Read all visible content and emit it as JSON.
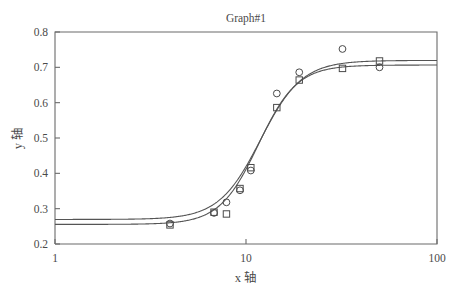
{
  "chart_data": {
    "type": "line",
    "title": "Graph#1",
    "xlabel": "x 轴",
    "ylabel": "y 轴",
    "xscale": "log",
    "yscale": "linear",
    "xlim": [
      1,
      100
    ],
    "ylim": [
      0.2,
      0.8
    ],
    "xticks": [
      1,
      10,
      100
    ],
    "xtick_labels": [
      "1",
      "10",
      "100"
    ],
    "yticks": [
      0.2,
      0.3,
      0.4,
      0.5,
      0.6,
      0.7,
      0.8
    ],
    "ytick_labels": [
      "0.2",
      "0.3",
      "0.4",
      "0.5",
      "0.6",
      "0.7",
      "0.8"
    ],
    "grid": false,
    "legend": "none",
    "series": [
      {
        "name": "series-circle",
        "marker": "circle",
        "x": [
          4.0,
          6.8,
          7.9,
          9.3,
          10.6,
          14.5,
          19.0,
          32.0,
          50.0
        ],
        "y": [
          0.258,
          0.288,
          0.318,
          0.352,
          0.408,
          0.626,
          0.686,
          0.752,
          0.7
        ],
        "fit": {
          "model": "logistic",
          "bottom": 0.2555,
          "top": 0.7065,
          "ec50": 11.6,
          "hill": 4.3
        }
      },
      {
        "name": "series-square",
        "marker": "square",
        "x": [
          4.0,
          6.8,
          7.9,
          9.3,
          10.6,
          14.5,
          19.0,
          32.0,
          50.0
        ],
        "y": [
          0.254,
          0.29,
          0.285,
          0.357,
          0.416,
          0.586,
          0.664,
          0.697,
          0.718
        ],
        "fit": {
          "model": "logistic",
          "bottom": 0.2695,
          "top": 0.7195,
          "ec50": 11.9,
          "hill": 4.0
        }
      }
    ]
  },
  "layout": {
    "plot_left": 55,
    "plot_right": 437,
    "plot_top": 32,
    "plot_bottom": 244
  },
  "colors": {
    "axis": "#6b6b6b",
    "curve": "#555555",
    "marker": "#4a4a4a",
    "text": "#4a4a4a",
    "background": "#ffffff"
  }
}
